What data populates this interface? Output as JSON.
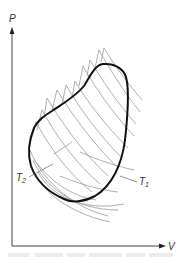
{
  "diagram": {
    "type": "pv-diagram",
    "axes": {
      "y_label": "P",
      "x_label": "V"
    },
    "labels": {
      "t1_main": "T",
      "t1_sub": "1",
      "t2_main": "T",
      "t2_sub": "2"
    },
    "colors": {
      "axis": "#444444",
      "cycle": "#111111",
      "isotherms": "#9a9a9a",
      "caption": "#ececec"
    }
  },
  "caption": {
    "text": ""
  }
}
